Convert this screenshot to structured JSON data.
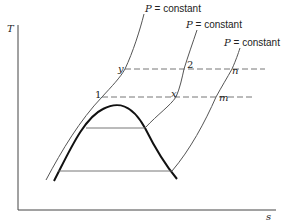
{
  "axes": {
    "y_label": "T",
    "x_label": "s"
  },
  "isobars": [
    {
      "label_var": "P",
      "label_eq": " = constant"
    },
    {
      "label_var": "P",
      "label_eq": " = constant"
    },
    {
      "label_var": "P",
      "label_eq": " = constant"
    }
  ],
  "points": {
    "one": "1",
    "two": "2",
    "x": "x",
    "y": "y",
    "m": "m",
    "n": "n"
  },
  "colors": {
    "line": "#555555",
    "dome": "#111111",
    "axis": "#444444",
    "dash": "#666666"
  }
}
